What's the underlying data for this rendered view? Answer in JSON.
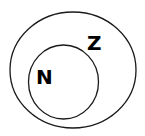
{
  "diagram": {
    "type": "euler",
    "sets": [
      {
        "id": "Z",
        "label": "Z",
        "contains": [
          "N"
        ]
      },
      {
        "id": "N",
        "label": "N",
        "subset_of": "Z"
      }
    ]
  }
}
